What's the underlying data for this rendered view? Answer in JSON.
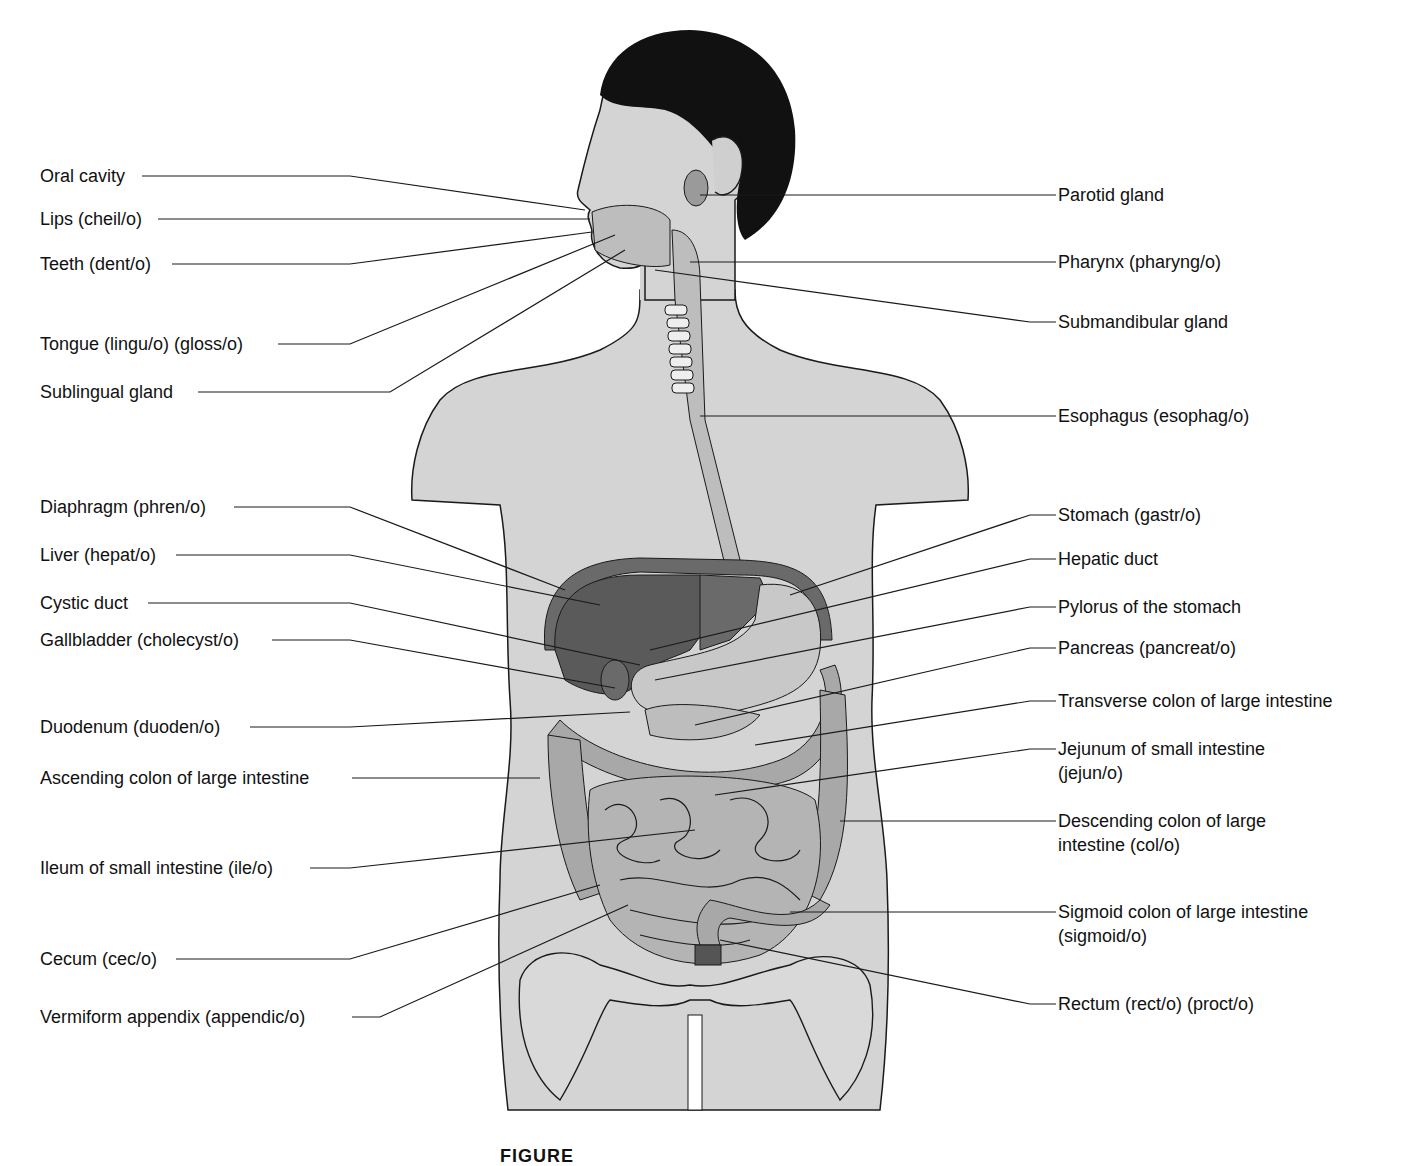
{
  "diagram": {
    "caption_visible": "FIGURE",
    "left_labels": [
      {
        "text": "Oral cavity",
        "y": 176
      },
      {
        "text": "Lips (cheil/o)",
        "y": 219
      },
      {
        "text": "Teeth (dent/o)",
        "y": 264
      },
      {
        "text": "Tongue (lingu/o) (gloss/o)",
        "y": 344
      },
      {
        "text": "Sublingual gland",
        "y": 392
      },
      {
        "text": "Diaphragm (phren/o)",
        "y": 507
      },
      {
        "text": "Liver (hepat/o)",
        "y": 555
      },
      {
        "text": "Cystic duct",
        "y": 603
      },
      {
        "text": "Gallbladder (cholecyst/o)",
        "y": 640
      },
      {
        "text": "Duodenum (duoden/o)",
        "y": 727
      },
      {
        "text": "Ascending colon of large intestine",
        "y": 778
      },
      {
        "text": "Ileum of small intestine (ile/o)",
        "y": 868
      },
      {
        "text": "Cecum (cec/o)",
        "y": 959
      },
      {
        "text": "Vermiform appendix (appendic/o)",
        "y": 1017
      }
    ],
    "right_labels": [
      {
        "text": "Parotid gland",
        "y": 195
      },
      {
        "text": "Pharynx (pharyng/o)",
        "y": 262
      },
      {
        "text": "Submandibular gland",
        "y": 322
      },
      {
        "text": "Esophagus (esophag/o)",
        "y": 416
      },
      {
        "text": "Stomach (gastr/o)",
        "y": 515
      },
      {
        "text": "Hepatic duct",
        "y": 559
      },
      {
        "text": "Pylorus of the stomach",
        "y": 607
      },
      {
        "text": "Pancreas (pancreat/o)",
        "y": 648
      },
      {
        "text": "Transverse colon of large intestine",
        "y": 701
      },
      {
        "text": "Jejunum of small intestine",
        "line2": "(jejun/o)",
        "y": 749
      },
      {
        "text": "Descending colon of large",
        "line2": "intestine (col/o)",
        "y": 821
      },
      {
        "text": "Sigmoid colon of large intestine",
        "line2": "(sigmoid/o)",
        "y": 912
      },
      {
        "text": "Rectum (rect/o) (proct/o)",
        "y": 1004
      }
    ],
    "colors": {
      "body": "#d4d4d4",
      "outline": "#1a1a1a",
      "hair": "#111111",
      "liver": "#5a5a5a",
      "organ_light": "#bdbdbd",
      "organ_mid": "#9a9a9a"
    }
  }
}
